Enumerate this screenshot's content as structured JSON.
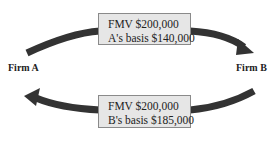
{
  "diagram": {
    "nodes": [
      {
        "id": "firm_a",
        "label": "Firm A"
      },
      {
        "id": "firm_b",
        "label": "Firm B"
      }
    ],
    "transfers": {
      "a_to_b": {
        "line1": "FMV $200,000",
        "line2": "A's basis $140,000"
      },
      "b_to_a": {
        "line1": "FMV $200,000",
        "line2": "B's basis $185,000"
      }
    },
    "colors": {
      "arrow": "#333333",
      "box_fill": "#e6e6e6",
      "box_border": "#8a8a8a"
    }
  }
}
